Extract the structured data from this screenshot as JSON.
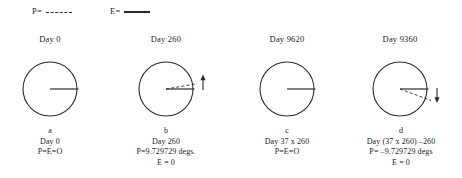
{
  "legend": {
    "items": [
      {
        "name": "P",
        "label": "P=",
        "style": "dashed"
      },
      {
        "name": "E",
        "label": "E=",
        "style": "solid"
      }
    ]
  },
  "panels": [
    {
      "id": "a",
      "heading": "Day 0",
      "caption_letter": "a",
      "caption_lines": [
        "Day 0",
        "P=E=O"
      ],
      "dashed_line": false,
      "arrow": "none"
    },
    {
      "id": "b",
      "heading": "Day 260",
      "caption_letter": "b",
      "caption_lines": [
        "Day 260",
        "P=9.729729 degs.",
        "E = 0"
      ],
      "dashed_line": true,
      "dashed_angle_degrees": 9.729729,
      "arrow": "up"
    },
    {
      "id": "c",
      "heading": "Day 9620",
      "caption_letter": "c",
      "caption_lines": [
        "Day 37 x 260",
        "P=E=O"
      ],
      "dashed_line": false,
      "arrow": "none"
    },
    {
      "id": "d",
      "heading": "Day 9360",
      "caption_letter": "d",
      "caption_lines": [
        "Day (37 x 260) –260",
        "P= –9.729729 degs",
        "E = 0"
      ],
      "dashed_line": true,
      "dashed_angle_degrees": -9.729729,
      "arrow": "down"
    }
  ],
  "colors": {
    "ink": "#2a2a2a",
    "background": "#ffffff"
  }
}
